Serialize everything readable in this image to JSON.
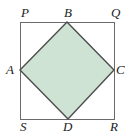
{
  "figure": {
    "type": "geometry-diagram",
    "canvas": {
      "width": 127,
      "height": 136
    },
    "background_color": "#ffffff",
    "outer_square": {
      "name": "PQRS",
      "stroke_color": "#6b6b6b",
      "stroke_width": 1,
      "fill": "none",
      "corners": [
        {
          "label": "P",
          "x": 20,
          "y": 22,
          "position": "top-left"
        },
        {
          "label": "Q",
          "x": 114,
          "y": 22,
          "position": "top-right"
        },
        {
          "label": "R",
          "x": 114,
          "y": 119,
          "position": "bottom-right"
        },
        {
          "label": "S",
          "x": 20,
          "y": 119,
          "position": "bottom-left"
        }
      ]
    },
    "inner_square": {
      "name": "ABCD",
      "stroke_color": "#4d4d4d",
      "stroke_width": 1.4,
      "fill_color": "#cfe3d4",
      "vertices": [
        {
          "label": "B",
          "x": 67,
          "y": 22,
          "position": "top-midpoint"
        },
        {
          "label": "C",
          "x": 114,
          "y": 70,
          "position": "right-midpoint"
        },
        {
          "label": "D",
          "x": 68,
          "y": 119,
          "position": "bottom-midpoint"
        },
        {
          "label": "A",
          "x": 20,
          "y": 70,
          "position": "left-midpoint"
        }
      ]
    },
    "labels": {
      "P": "P",
      "Q": "Q",
      "R": "R",
      "S": "S",
      "A": "A",
      "B": "B",
      "C": "C",
      "D": "D"
    }
  }
}
